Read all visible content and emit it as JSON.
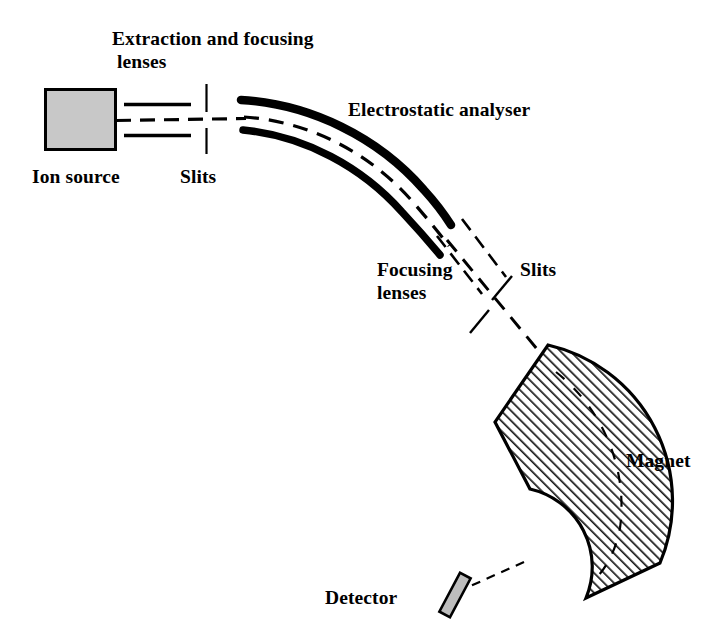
{
  "figure": {
    "background_color": "#ffffff",
    "stroke_color": "#000000",
    "ion_source_fill": "#c8c8c8",
    "detector_fill": "#bdbdbd",
    "hatch_color": "#1a1a1a"
  },
  "labels": {
    "extraction_lenses": "Extraction and focusing\n lenses",
    "ion_source": "Ion source",
    "slits_1": "Slits",
    "electrostatic_analyser": "Electrostatic analyser",
    "focusing_lenses": "Focusing\nlenses",
    "slits_2": "Slits",
    "magnet": "Magnet",
    "detector": "Detector"
  },
  "components": [
    {
      "name": "ion-source",
      "kind": "filled-rect",
      "x": 44,
      "y": 88,
      "width": 72,
      "height": 62,
      "fill": "#c8c8c8",
      "stroke": "#000000",
      "stroke_width": 3
    },
    {
      "name": "extraction-lens-plate-upper",
      "kind": "line",
      "x1": 124,
      "y1": 104,
      "x2": 190,
      "y2": 104,
      "stroke_width": 3
    },
    {
      "name": "extraction-lens-plate-lower",
      "kind": "line",
      "x1": 124,
      "y1": 135,
      "x2": 190,
      "y2": 135,
      "stroke_width": 3
    },
    {
      "name": "slit-mark-upper-1",
      "kind": "line",
      "x1": 206,
      "y1": 85,
      "x2": 206,
      "y2": 112,
      "stroke_width": 2
    },
    {
      "name": "slit-mark-lower-1",
      "kind": "line",
      "x1": 206,
      "y1": 127,
      "x2": 206,
      "y2": 153,
      "stroke_width": 2
    },
    {
      "name": "beam-path-source-to-analyser",
      "kind": "dashed-line",
      "x1": 116,
      "y1": 120,
      "x2": 244,
      "y2": 118,
      "stroke_width": 3
    },
    {
      "name": "electrostatic-analyser-outer-plate",
      "kind": "arc",
      "stroke_width": 8,
      "description": "outer curved electrode of electrostatic sector"
    },
    {
      "name": "electrostatic-analyser-inner-plate",
      "kind": "arc",
      "stroke_width": 7,
      "description": "inner curved electrode of electrostatic sector"
    },
    {
      "name": "beam-path-analyser",
      "kind": "dashed-arc",
      "stroke_width": 3,
      "description": "ion beam curving through electrostatic analyser"
    },
    {
      "name": "focusing-lens-rail-left",
      "kind": "dashed-line",
      "description": "diagonal lens element left of beam"
    },
    {
      "name": "focusing-lens-rail-right",
      "kind": "dashed-line",
      "description": "diagonal lens element right of beam"
    },
    {
      "name": "beam-path-diagonal",
      "kind": "dashed-line",
      "x1": 446,
      "y1": 224,
      "x2": 548,
      "y2": 360,
      "stroke_width": 3
    },
    {
      "name": "slit-mark-upper-2",
      "kind": "line",
      "stroke_width": 2,
      "description": "slit tick crossing diagonal beam, upper-right"
    },
    {
      "name": "slit-mark-lower-2",
      "kind": "line",
      "stroke_width": 2,
      "description": "slit tick crossing diagonal beam, lower-left"
    },
    {
      "name": "magnet-sector",
      "kind": "hatched-annular-sector",
      "fill": "hatch-45",
      "stroke": "#000000",
      "stroke_width": 3,
      "description": "C-shaped magnetic sector with 45 degree hatching"
    },
    {
      "name": "beam-path-magnet",
      "kind": "dashed-arc",
      "stroke_width": 2,
      "description": "ion beam curving through the magnet sector"
    },
    {
      "name": "beam-path-to-detector",
      "kind": "dashed-line",
      "x1": 516,
      "y1": 566,
      "x2": 466,
      "y2": 588,
      "stroke_width": 2
    },
    {
      "name": "detector-plate",
      "kind": "tilted-rect",
      "fill": "#bdbdbd",
      "stroke": "#000000",
      "stroke_width": 2.5,
      "rotation_deg": 28,
      "description": "small detector plate at beam terminus"
    }
  ]
}
